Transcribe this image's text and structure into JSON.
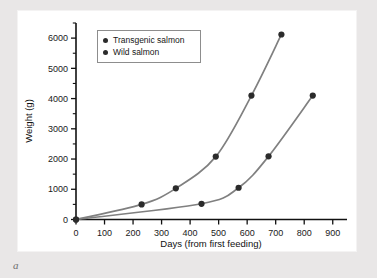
{
  "figure": {
    "caption_label": "a"
  },
  "legend": {
    "position": "top-left",
    "items": [
      {
        "label": "Transgenic salmon",
        "marker": "filled-circle",
        "color": "#2b2b2b"
      },
      {
        "label": "Wild salmon",
        "marker": "filled-circle",
        "color": "#2b2b2b"
      }
    ]
  },
  "chart_data": {
    "type": "line",
    "title": "",
    "xlabel": "Days (from first feeding)",
    "ylabel": "Weight (g)",
    "xlim": [
      0,
      950
    ],
    "ylim": [
      0,
      6500
    ],
    "grid": false,
    "xticks": [
      0,
      100,
      200,
      300,
      400,
      500,
      600,
      700,
      800,
      900
    ],
    "xtick_labels": [
      "0",
      "100",
      "200",
      "300",
      "400",
      "500",
      "600",
      "700",
      "800",
      "900"
    ],
    "yticks": [
      0,
      1000,
      2000,
      3000,
      4000,
      5000,
      6000
    ],
    "ytick_labels": [
      "0",
      "1000",
      "2000",
      "3000",
      "4000",
      "5000",
      "6000"
    ],
    "y_minor_ticks": [
      500,
      1500,
      2500,
      3500,
      4500,
      5500,
      6500
    ],
    "legend_position": "top-left",
    "series": [
      {
        "name": "Transgenic salmon",
        "color": "#808080",
        "marker_color": "#2b2b2b",
        "x": [
          0,
          230,
          350,
          490,
          615,
          720
        ],
        "y": [
          0,
          500,
          1030,
          2080,
          4100,
          6120
        ]
      },
      {
        "name": "Wild salmon",
        "color": "#808080",
        "marker_color": "#2b2b2b",
        "x": [
          0,
          440,
          570,
          675,
          830
        ],
        "y": [
          0,
          520,
          1050,
          2090,
          4100
        ]
      }
    ]
  },
  "colors": {
    "background": "#e9e7e7",
    "panel": "#ffffff",
    "axis": "#111111",
    "line": "#808080",
    "marker": "#2b2b2b"
  }
}
